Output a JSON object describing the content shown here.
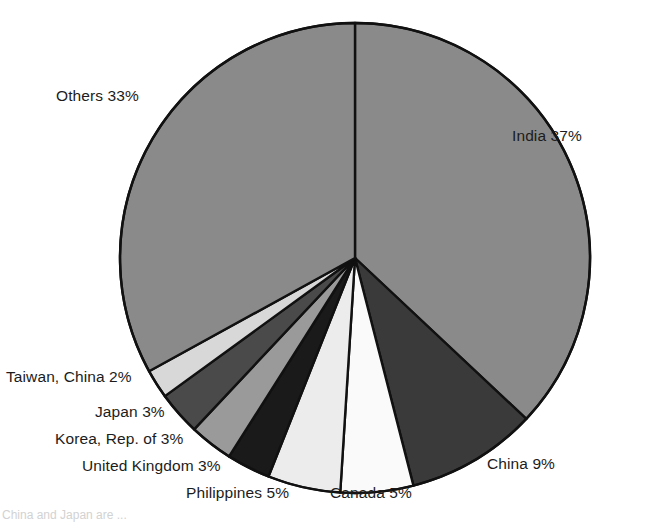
{
  "chart_data": {
    "type": "pie",
    "title": "",
    "subtitle": "",
    "xlabel": "",
    "ylabel": "",
    "grid": false,
    "legend_position": "none",
    "label_format": "name + percent",
    "start_angle_deg": 0,
    "direction": "clockwise",
    "units": "percent",
    "total": 100,
    "categories": [
      "India",
      "China",
      "Canada",
      "Philippines",
      "United Kingdom",
      "Korea, Rep. of",
      "Japan",
      "Taiwan, China",
      "Others"
    ],
    "values": [
      37,
      9,
      5,
      5,
      3,
      3,
      3,
      2,
      33
    ],
    "slices": [
      {
        "name": "India",
        "value": 37,
        "label": "India 37%",
        "color": "#8a8a8a"
      },
      {
        "name": "China",
        "value": 9,
        "label": "China 9%",
        "color": "#3a3a3a"
      },
      {
        "name": "Canada",
        "value": 5,
        "label": "Canada 5%",
        "color": "#fafafa"
      },
      {
        "name": "Philippines",
        "value": 5,
        "label": "Philippines 5%",
        "color": "#ececec"
      },
      {
        "name": "United Kingdom",
        "value": 3,
        "label": "United Kingdom  3%",
        "color": "#1a1a1a"
      },
      {
        "name": "Korea, Rep. of",
        "value": 3,
        "label": "Korea, Rep. of  3%",
        "color": "#9a9a9a"
      },
      {
        "name": "Japan",
        "value": 3,
        "label": "Japan 3%",
        "color": "#4a4a4a"
      },
      {
        "name": "Taiwan, China",
        "value": 2,
        "label": "Taiwan, China 2%",
        "color": "#d8d8d8"
      },
      {
        "name": "Others",
        "value": 33,
        "label": "Others 33%",
        "color": "#8a8a8a"
      }
    ],
    "geometry": {
      "center_x": 355,
      "center_y": 258,
      "radius": 235,
      "outline_color": "#111111",
      "outline_width": 2.4
    }
  },
  "labels": {
    "others": "Others 33%",
    "india": "India 37%",
    "taiwan": "Taiwan, China 2%",
    "japan": "Japan 3%",
    "korea": "Korea, Rep. of  3%",
    "uk": "United Kingdom  3%",
    "philippines": "Philippines  5%",
    "canada": "Canada 5%",
    "china": "China 9%"
  },
  "footnote": {
    "text": "China and Japan are ..."
  }
}
